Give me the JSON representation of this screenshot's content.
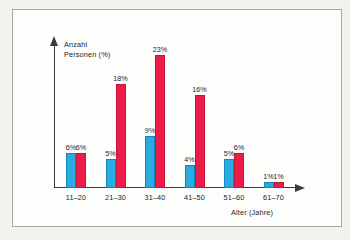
{
  "chart_data": {
    "type": "bar",
    "title": "",
    "xlabel": "Alter (Jahre)",
    "ylabel": "Anzahl\nPersonen (%)",
    "categories": [
      "11–20",
      "21–30",
      "31–40",
      "41–50",
      "51–60",
      "61–70"
    ],
    "series": [
      {
        "name": "blue",
        "color": "#29abe2",
        "values": [
          6,
          5,
          9,
          4,
          5,
          1
        ],
        "labels": [
          "6%",
          "5%",
          "9%",
          "4%",
          "5%",
          "1%"
        ]
      },
      {
        "name": "red",
        "color": "#ed1b48",
        "values": [
          6,
          18,
          23,
          16,
          6,
          1
        ],
        "labels": [
          "6%",
          "18%",
          "23%",
          "16%",
          "6%",
          "1%"
        ]
      }
    ],
    "ylim": [
      0,
      24
    ],
    "grid": false,
    "legend": "none",
    "axis_color": "#3b3b3b"
  },
  "frame": {
    "page_background": "#f4f2ee",
    "panel_background": "#fdfdfc",
    "panel_border": "#a9a7a3"
  }
}
